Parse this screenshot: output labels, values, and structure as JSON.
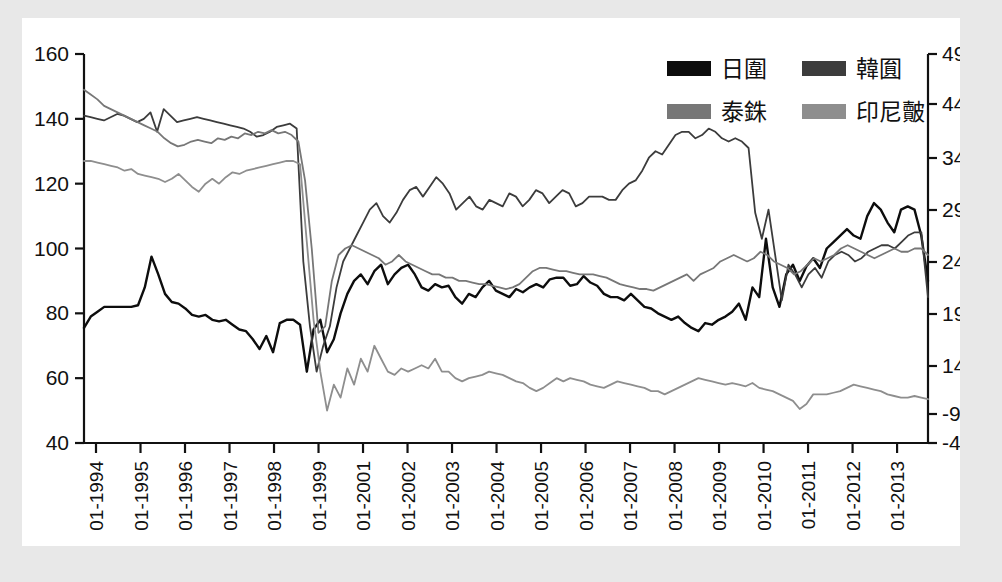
{
  "chart_data": {
    "type": "line",
    "title": "",
    "subtitle": "",
    "xlabel": "",
    "ylabel": "",
    "grid": false,
    "legend_position": "top-right",
    "left_axis": {
      "ticks": [
        160,
        140,
        120,
        100,
        80,
        60,
        40
      ],
      "ylim": [
        40,
        160
      ],
      "tick_labels": [
        "160",
        "140",
        "120",
        "100",
        "80",
        "60",
        "40"
      ]
    },
    "right_axis": {
      "tick_labels": [
        "490",
        "440",
        "340",
        "290",
        "240",
        "190",
        "140",
        "-90",
        "-40"
      ],
      "ticks": [
        490,
        440,
        340,
        290,
        240,
        190,
        140,
        90,
        40
      ]
    },
    "x_tick_labels": [
      "01-1994",
      "01-1995",
      "01-1996",
      "01-1997",
      "01-1998",
      "01-1999",
      "01-2001",
      "01-2002",
      "01-2003",
      "01-2004",
      "01-2005",
      "01-2006",
      "01-2007",
      "01-2008",
      "01-2009",
      "01-2010",
      "01-2011",
      "01-2012",
      "01-2013"
    ],
    "legend": [
      {
        "label": "日圍",
        "color": "#0d0d0d",
        "key": "jpy"
      },
      {
        "label": "韓圎",
        "color": "#3c3c3c",
        "key": "krw"
      },
      {
        "label": "泰銖",
        "color": "#777777",
        "key": "thb"
      },
      {
        "label": "印尼皾",
        "color": "#8e8e8e",
        "key": "idr"
      }
    ],
    "series": [
      {
        "name": "日圍",
        "key": "jpy",
        "color": "#0d0d0d",
        "width": 2.4,
        "values": [
          75.5,
          79.0,
          80.5,
          82.0,
          82.0,
          82.0,
          82.0,
          82.0,
          82.5,
          88.0,
          97.5,
          92.0,
          86.0,
          83.5,
          83.0,
          81.5,
          79.5,
          79.0,
          79.5,
          78.0,
          77.5,
          78.0,
          76.5,
          75.0,
          74.5,
          72.0,
          69.0,
          73.0,
          68.0,
          77.0,
          78.0,
          78.0,
          76.5,
          62.0,
          75.0,
          78.0,
          68.0,
          72.0,
          80.0,
          86.0,
          90.0,
          92.0,
          89.0,
          93.0,
          95.0,
          89.0,
          92.0,
          94.0,
          95.0,
          92.0,
          88.0,
          87.0,
          89.0,
          88.0,
          88.5,
          85.0,
          83.0,
          86.0,
          85.0,
          88.0,
          90.0,
          87.0,
          86.0,
          85.0,
          87.5,
          86.5,
          88.0,
          89.0,
          88.0,
          90.5,
          91.0,
          91.0,
          88.5,
          89.0,
          91.5,
          89.5,
          88.5,
          86.0,
          85.0,
          85.0,
          84.0,
          86.0,
          84.0,
          82.0,
          81.5,
          80.0,
          79.0,
          78.0,
          79.0,
          77.0,
          75.5,
          74.5,
          77.0,
          76.5,
          78.0,
          79.0,
          80.5,
          83.0,
          78.0,
          88.0,
          85.0,
          103.0,
          88.0,
          82.0,
          92.0,
          95.0,
          90.0,
          94.5,
          97.0,
          94.0,
          100.0,
          102.0,
          104.0,
          106.0,
          104.0,
          103.0,
          110.0,
          114.0,
          112.0,
          108.0,
          105.0,
          112.0,
          113.0,
          112.0,
          104.0,
          90.0
        ]
      },
      {
        "name": "韓圎",
        "key": "krw",
        "color": "#3c3c3c",
        "width": 1.8,
        "values": [
          141.0,
          140.5,
          140.0,
          139.5,
          140.5,
          141.5,
          141.0,
          140.0,
          139.0,
          140.0,
          142.0,
          136.0,
          143.0,
          141.0,
          139.0,
          139.5,
          140.0,
          140.5,
          140.0,
          139.5,
          139.0,
          138.5,
          138.0,
          137.5,
          137.0,
          136.0,
          134.5,
          135.0,
          136.0,
          137.5,
          138.0,
          138.5,
          137.0,
          96.0,
          76.0,
          62.0,
          70.0,
          76.0,
          88.0,
          96.0,
          100.0,
          104.0,
          108.0,
          112.0,
          114.0,
          110.0,
          108.0,
          111.0,
          115.0,
          118.0,
          119.0,
          116.0,
          119.0,
          122.0,
          120.0,
          117.0,
          112.0,
          114.0,
          116.0,
          113.0,
          112.0,
          115.0,
          114.0,
          113.0,
          117.0,
          116.0,
          113.0,
          115.0,
          118.0,
          117.0,
          114.0,
          116.0,
          118.0,
          117.0,
          113.0,
          114.0,
          116.0,
          116.0,
          116.0,
          115.0,
          115.0,
          118.0,
          120.0,
          121.0,
          124.0,
          128.0,
          130.0,
          129.0,
          132.0,
          135.0,
          136.0,
          136.0,
          134.0,
          135.0,
          137.0,
          136.0,
          134.0,
          133.0,
          134.0,
          133.0,
          131.0,
          111.0,
          103.0,
          112.0,
          98.0,
          84.0,
          95.0,
          92.0,
          88.0,
          92.0,
          94.0,
          91.0,
          96.0,
          98.0,
          99.0,
          98.0,
          96.0,
          97.0,
          99.0,
          100.0,
          101.0,
          101.0,
          100.0,
          102.0,
          104.0,
          105.0,
          105.0,
          85.0
        ]
      },
      {
        "name": "泰銖",
        "key": "thb",
        "color": "#777777",
        "width": 1.8,
        "values": [
          149.0,
          147.5,
          146.0,
          144.0,
          143.0,
          142.0,
          141.0,
          140.0,
          139.0,
          138.0,
          137.0,
          136.0,
          134.0,
          132.5,
          131.5,
          132.0,
          133.0,
          133.5,
          133.0,
          132.5,
          134.0,
          133.5,
          134.5,
          134.0,
          135.5,
          135.0,
          136.0,
          135.5,
          136.5,
          135.5,
          136.0,
          135.0,
          133.0,
          121.0,
          100.0,
          74.0,
          76.0,
          90.0,
          98.0,
          100.0,
          101.0,
          100.0,
          99.0,
          98.0,
          97.0,
          95.0,
          96.0,
          98.0,
          96.0,
          95.0,
          94.0,
          93.0,
          92.0,
          92.0,
          91.0,
          91.0,
          90.0,
          90.0,
          89.5,
          89.0,
          89.0,
          88.5,
          88.0,
          87.5,
          88.0,
          89.0,
          91.0,
          93.0,
          94.0,
          94.0,
          93.5,
          93.0,
          93.0,
          92.5,
          92.0,
          92.0,
          92.0,
          91.5,
          91.0,
          90.0,
          89.0,
          88.5,
          88.0,
          87.5,
          87.5,
          87.0,
          88.0,
          89.0,
          90.0,
          91.0,
          92.0,
          90.0,
          92.0,
          93.0,
          94.0,
          96.0,
          97.0,
          98.0,
          97.0,
          96.0,
          97.0,
          99.0,
          98.0,
          96.0,
          95.0,
          94.0,
          92.0,
          93.0,
          95.0,
          97.0,
          96.0,
          97.0,
          98.0,
          100.0,
          101.0,
          100.0,
          99.0,
          98.0,
          97.0,
          98.0,
          99.0,
          100.0,
          99.0,
          99.0,
          100.0,
          100.0,
          98.0
        ]
      },
      {
        "name": "印尼皾",
        "key": "idr",
        "color": "#8e8e8e",
        "width": 1.8,
        "values": [
          127.0,
          127.0,
          126.5,
          126.0,
          125.5,
          125.0,
          124.0,
          124.5,
          123.0,
          122.5,
          122.0,
          121.5,
          120.5,
          121.5,
          123.0,
          121.0,
          119.0,
          117.5,
          120.0,
          121.5,
          120.0,
          122.0,
          123.5,
          123.0,
          124.0,
          124.5,
          125.0,
          125.5,
          126.0,
          126.5,
          127.0,
          127.0,
          126.0,
          102.0,
          78.0,
          62.0,
          50.0,
          58.0,
          54.0,
          63.0,
          58.0,
          66.0,
          62.0,
          70.0,
          66.0,
          62.0,
          61.0,
          63.0,
          62.0,
          63.0,
          64.0,
          63.0,
          66.0,
          62.0,
          62.0,
          60.0,
          59.0,
          60.0,
          60.5,
          61.0,
          62.0,
          61.5,
          61.0,
          60.0,
          59.0,
          58.5,
          57.0,
          56.0,
          57.0,
          58.5,
          60.0,
          59.0,
          60.0,
          59.5,
          59.0,
          58.0,
          57.5,
          57.0,
          58.0,
          59.0,
          58.5,
          58.0,
          57.5,
          57.0,
          56.0,
          56.0,
          55.0,
          56.0,
          57.0,
          58.0,
          59.0,
          60.0,
          59.5,
          59.0,
          58.5,
          58.0,
          58.5,
          58.0,
          57.5,
          58.5,
          57.0,
          56.5,
          56.0,
          55.0,
          54.0,
          53.0,
          50.5,
          52.0,
          55.0,
          55.0,
          55.0,
          55.5,
          56.0,
          57.0,
          58.0,
          57.5,
          57.0,
          56.5,
          56.0,
          55.0,
          54.5,
          54.0,
          54.0,
          54.5,
          54.0,
          53.5
        ]
      }
    ]
  }
}
